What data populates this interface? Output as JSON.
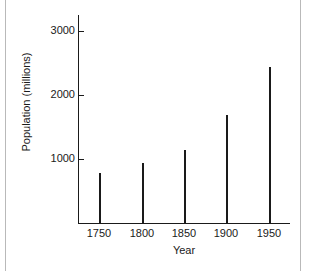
{
  "chart_data": {
    "type": "bar",
    "title": "",
    "xlabel": "Year",
    "ylabel": "Population (millions)",
    "categories": [
      "1750",
      "1800",
      "1850",
      "1900",
      "1950"
    ],
    "values": [
      780,
      940,
      1140,
      1690,
      2440
    ],
    "series": [
      {
        "name": "Population (millions)",
        "values": [
          780,
          940,
          1140,
          1690,
          2440
        ]
      }
    ],
    "x_tick_labels": [
      "1750",
      "1800",
      "1850",
      "1900",
      "1950"
    ],
    "y_tick_labels": [
      "1000",
      "2000",
      "3000"
    ],
    "y_tick_values": [
      1000,
      2000,
      3000
    ],
    "ylim": [
      0,
      3250
    ],
    "xlim": [
      1725,
      1975
    ],
    "grid": false,
    "legend": false,
    "legend_position": "none",
    "bar_color": "#1a1a1a",
    "axis_color": "#1a1a1a",
    "background_color": "#ffffff"
  },
  "figure": {
    "frame_color": "#b9b9b9"
  }
}
